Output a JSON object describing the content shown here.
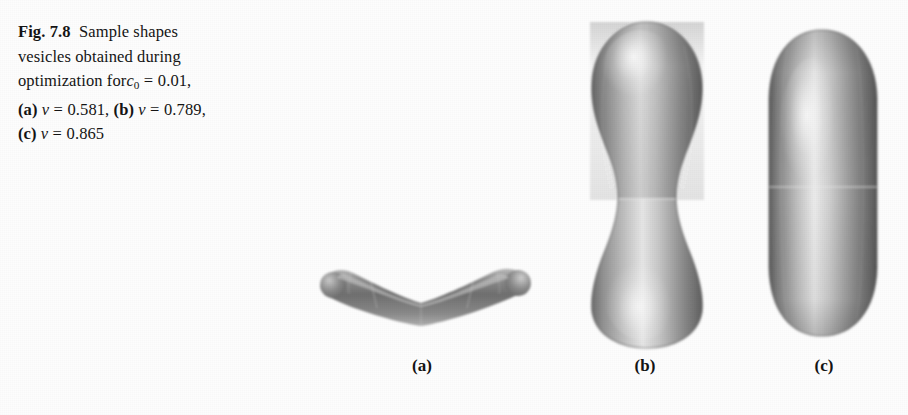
{
  "figure": {
    "label": "Fig. 7.8",
    "caption_lines": [
      "Fig. 7.8  Sample shapes",
      "vesicles obtained during",
      "optimization for c0 = 0.01,",
      "(a) v = 0.581, (b) v = 0.789,",
      "(c) v = 0.865"
    ],
    "caption_text": "Fig. 7.8 Sample shapes vesicles obtained during optimization for c0 = 0.01, (a) v = 0.581, (b) v = 0.789, (c) v = 0.865",
    "caption_parts": {
      "fig_number": "Fig. 7.8",
      "line1_rest": "Sample shapes",
      "line2": "vesicles obtained during",
      "line3_pre": "optimization for",
      "line3_symbol": "c",
      "line3_subscript": "0",
      "line3_eq": "=",
      "line3_value": "0.01,",
      "line4_a_tag": "(a)",
      "line4_a_symbol": "ν",
      "line4_a_eq": "=",
      "line4_a_value": "0.581,",
      "line4_b_tag": "(b)",
      "line4_b_symbol": "ν",
      "line4_b_eq": "=",
      "line4_b_value": "0.789,",
      "line5_c_tag": "(c)",
      "line5_c_symbol": "ν",
      "line5_c_eq": "=",
      "line5_c_value": "0.865"
    }
  },
  "panels": [
    {
      "id": "a",
      "label": "(a)",
      "shape_name": "boomerang-vesicle",
      "reduced_volume": 0.581,
      "parameter_symbol": "ν",
      "description": "flattened V-shaped boomerang vesicle with rounded ends, opening upward"
    },
    {
      "id": "b",
      "label": "(b)",
      "shape_name": "dumbbell-vesicle",
      "reduced_volume": 0.789,
      "parameter_symbol": "ν",
      "description": "peanut / dumbbell shaped vesicle with central waist constriction"
    },
    {
      "id": "c",
      "label": "(c)",
      "shape_name": "prolate-capsule-vesicle",
      "reduced_volume": 0.865,
      "parameter_symbol": "ν",
      "description": "elongated prolate capsule shaped vesicle"
    }
  ],
  "colors": {
    "page_background": "#fdfdfd",
    "text": "#151515",
    "shading_light": "#f2f2f2",
    "shading_mid": "#9a9a9a",
    "shading_dark": "#555555",
    "shading_edge": "#6d6d6d"
  },
  "constants": {
    "spontaneous_curvature_symbol": "c0",
    "spontaneous_curvature_value": "0.01"
  }
}
